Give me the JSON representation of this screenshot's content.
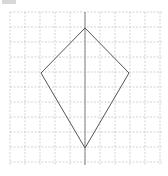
{
  "diagram": {
    "type": "kite-on-grid",
    "grid": {
      "x0": 10,
      "y0": 12,
      "x1": 162,
      "y1": 165,
      "spacing": 15,
      "color": "#c8c8c8",
      "style": "dashed"
    },
    "axis": {
      "x": 85,
      "y0": 12,
      "y1": 165,
      "color": "#777777"
    },
    "kite": {
      "vertices": [
        [
          85,
          28
        ],
        [
          129,
          73
        ],
        [
          85,
          148
        ],
        [
          41,
          73
        ]
      ],
      "stroke": "#555555"
    },
    "top_marker_color": "#d8d8d8"
  }
}
